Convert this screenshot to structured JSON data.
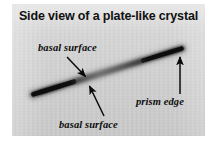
{
  "figure": {
    "kind": "photomicrograph-with-annotations",
    "title": "Side view of a plate-like crystal",
    "background_color": "#d2d2d2",
    "page_color": "#ffffff",
    "ink_color": "#111111",
    "labels": [
      {
        "id": "basal-surface-top",
        "text": "basal surface",
        "arrow": {
          "from_x": 55,
          "from_y": 53,
          "to_x": 75,
          "to_y": 74,
          "direction": "down-right",
          "points_to": "upper basal surface of crystal"
        }
      },
      {
        "id": "basal-surface-bottom",
        "text": "basal surface",
        "arrow": {
          "from_x": 92,
          "from_y": 112,
          "to_x": 77,
          "to_y": 80,
          "direction": "up-left",
          "points_to": "lower basal surface of crystal"
        }
      },
      {
        "id": "prism-edge",
        "text": "prism edge",
        "arrow": {
          "from_x": 168,
          "from_y": 92,
          "to_x": 168,
          "to_y": 52,
          "direction": "up",
          "points_to": "right end of crystal"
        }
      }
    ],
    "subject": {
      "name": "plate-like ice crystal",
      "description": "dark elongated sliver seen edge-on, running lower-left to upper-right",
      "left_tip_x": 21,
      "left_tip_y": 90,
      "right_tip_x": 170,
      "right_tip_y": 44,
      "thickness_px": 5,
      "tone": "darkest at both ends, softer and blurred near the middle"
    }
  }
}
